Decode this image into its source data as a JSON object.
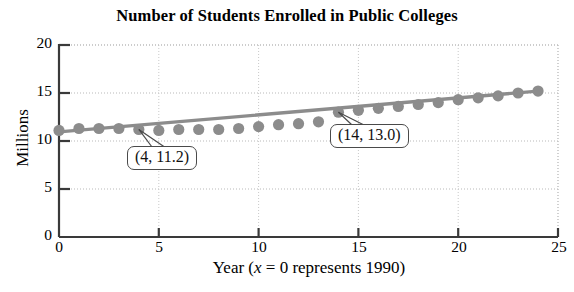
{
  "chart_data": {
    "type": "scatter",
    "title": "Number of Students Enrolled in Public Colleges",
    "xlabel_parts": {
      "pre": "Year (",
      "ital": "x",
      "post": " = 0 represents 1990)"
    },
    "xlabel": "Year (x = 0 represents 1990)",
    "ylabel": "Millions",
    "xlim": [
      0,
      25
    ],
    "ylim": [
      0,
      20
    ],
    "xticks": [
      0,
      5,
      10,
      15,
      20,
      25
    ],
    "yticks": [
      0,
      5,
      10,
      15,
      20
    ],
    "grid": "dotted horizontal and vertical gridlines at major ticks",
    "legend": "none",
    "marker_color": "#8c8c8c",
    "line_color": "#8c8c8c",
    "x": [
      0,
      1,
      2,
      3,
      4,
      5,
      6,
      7,
      8,
      9,
      10,
      11,
      12,
      13,
      14,
      15,
      16,
      17,
      18,
      19,
      20,
      21,
      22,
      23,
      24
    ],
    "values": [
      11.1,
      11.3,
      11.3,
      11.3,
      11.2,
      11.1,
      11.2,
      11.2,
      11.2,
      11.3,
      11.5,
      11.7,
      11.8,
      12.0,
      13.0,
      13.2,
      13.4,
      13.6,
      13.8,
      14.0,
      14.3,
      14.5,
      14.7,
      15.0,
      15.2
    ],
    "series": [
      {
        "name": "Students enrolled (millions)",
        "type": "scatter",
        "values": [
          11.1,
          11.3,
          11.3,
          11.3,
          11.2,
          11.1,
          11.2,
          11.2,
          11.2,
          11.3,
          11.5,
          11.7,
          11.8,
          12.0,
          13.0,
          13.2,
          13.4,
          13.6,
          13.8,
          14.0,
          14.3,
          14.5,
          14.7,
          15.0,
          15.2
        ]
      },
      {
        "name": "Line of best fit",
        "type": "line",
        "endpoints": [
          [
            0,
            10.95
          ],
          [
            24,
            15.2
          ]
        ]
      }
    ],
    "annotations": [
      {
        "label": "(4, 11.2)",
        "point": [
          4,
          11.2
        ]
      },
      {
        "label": "(14, 13.0)",
        "point": [
          14,
          13.0
        ]
      }
    ]
  }
}
